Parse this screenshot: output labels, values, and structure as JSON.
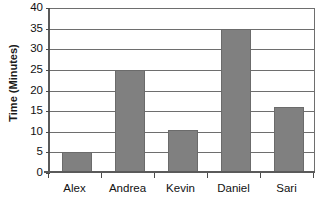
{
  "chart_data": {
    "type": "bar",
    "title": "",
    "subtitle": "",
    "xlabel": "",
    "ylabel": "Time (Minutes)",
    "categories": [
      "Alex",
      "Andrea",
      "Kevin",
      "Daniel",
      "Sari"
    ],
    "values": [
      5,
      25,
      10.5,
      35,
      16
    ],
    "ylim": [
      0,
      40
    ],
    "ytick_step": 5,
    "ytick_labels": [
      "0",
      "5",
      "10",
      "15",
      "20",
      "25",
      "30",
      "35",
      "40"
    ],
    "ytick_values": [
      0,
      5,
      10,
      15,
      20,
      25,
      30,
      35,
      40
    ],
    "grid": "horizontal",
    "legend": "none",
    "bar_color": "#808080",
    "bar_edge_color": "#6b6b6b",
    "axis_color": "#5a5a5a",
    "gridline_color": "#6e6e6e",
    "text_color": "#111111",
    "background": "#ffffff"
  }
}
